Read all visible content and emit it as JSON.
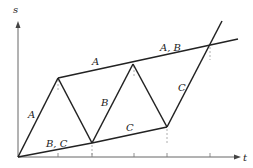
{
  "diagram": {
    "type": "space-time diagram",
    "axes": {
      "vertical_label": "s",
      "horizontal_label": "t"
    },
    "segment_labels": [
      {
        "id": "a-rise",
        "text": "A",
        "x": 28,
        "y": 118
      },
      {
        "id": "bc-lower",
        "text": "B, C",
        "x": 46,
        "y": 147
      },
      {
        "id": "a-upper",
        "text": "A",
        "x": 92,
        "y": 65
      },
      {
        "id": "b-rise",
        "text": "B",
        "x": 101,
        "y": 106
      },
      {
        "id": "c-lower",
        "text": "C",
        "x": 126,
        "y": 131
      },
      {
        "id": "ab-upper",
        "text": "A, B",
        "x": 160,
        "y": 51
      },
      {
        "id": "c-rise",
        "text": "C",
        "x": 178,
        "y": 91
      }
    ],
    "points": {
      "origin": [
        18,
        157
      ],
      "p1": [
        58,
        78
      ],
      "p2": [
        92,
        143
      ],
      "p3": [
        133,
        64
      ],
      "p4": [
        167,
        127
      ],
      "intersection": [
        210,
        45
      ],
      "upper_end": [
        238,
        39
      ],
      "c_end": [
        222,
        21
      ]
    },
    "ticks_x": [
      58,
      92,
      134,
      167,
      210
    ],
    "colors": {
      "line": "#222222",
      "dashed": "#999999"
    }
  }
}
